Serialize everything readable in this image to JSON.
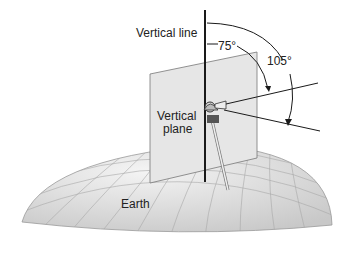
{
  "diagram": {
    "labels": {
      "vertical_line": "Vertical line",
      "angle_small": "75°",
      "angle_large": "105°",
      "vertical_plane_1": "Vertical",
      "vertical_plane_2": "plane",
      "earth": "Earth"
    },
    "colors": {
      "line": "#1a1a1a",
      "plane": "#e4e4e4",
      "earth": "#dcdcdc",
      "grid": "#a8a8a8"
    }
  }
}
